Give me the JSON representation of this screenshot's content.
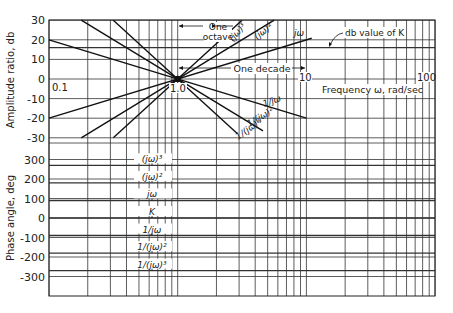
{
  "chart_data": [
    {
      "type": "line",
      "title": "Bode magnitude asymptotes",
      "xlabel": "Frequency ω, rad/sec",
      "ylabel": "Amplitude ratio, db",
      "xscale": "log",
      "xlim": [
        0.1,
        100
      ],
      "ylim": [
        -30,
        30
      ],
      "x_tick_labels": [
        "0.1",
        "1.0",
        "10",
        "100"
      ],
      "y_ticks": [
        30,
        20,
        10,
        0,
        -10,
        -20,
        -30
      ],
      "grid": true,
      "annotations": [
        "One octave",
        "One decade",
        "db value of K"
      ],
      "k_db": 16,
      "series": [
        {
          "name": "jω",
          "slope_db_per_decade": 20,
          "x": [
            0.1,
            11
          ],
          "y": [
            -20,
            20.8
          ]
        },
        {
          "name": "(jω)²",
          "slope_db_per_decade": 40,
          "x": [
            0.178,
            5.62
          ],
          "y": [
            -30,
            30
          ]
        },
        {
          "name": "(jω)³",
          "slope_db_per_decade": 60,
          "x": [
            0.316,
            3.16
          ],
          "y": [
            -30,
            30
          ]
        },
        {
          "name": "1/jω",
          "slope_db_per_decade": -20,
          "x": [
            0.1,
            10
          ],
          "y": [
            20,
            -20
          ]
        },
        {
          "name": "1/(jω)²",
          "slope_db_per_decade": -40,
          "x": [
            0.178,
            4.6
          ],
          "y": [
            30,
            -26.5
          ]
        },
        {
          "name": "1/(jω)³",
          "slope_db_per_decade": -60,
          "x": [
            0.316,
            2.9
          ],
          "y": [
            30,
            -27.8
          ]
        },
        {
          "name": "K",
          "slope_db_per_decade": 0,
          "x": [
            0.1,
            100
          ],
          "y": [
            16,
            16
          ]
        }
      ]
    },
    {
      "type": "line",
      "title": "Bode phase asymptotes",
      "xlabel": "",
      "ylabel": "Phase angle, deg",
      "xscale": "log",
      "xlim": [
        0.1,
        100
      ],
      "ylim": [
        -400,
        300
      ],
      "y_ticks": [
        300,
        200,
        100,
        0,
        -100,
        -200,
        -300
      ],
      "grid": true,
      "series": [
        {
          "name": "(jω)³",
          "value": 270
        },
        {
          "name": "(jω)²",
          "value": 180
        },
        {
          "name": "jω",
          "value": 90
        },
        {
          "name": "K",
          "value": 0
        },
        {
          "name": "1/jω",
          "value": -90
        },
        {
          "name": "1/(jω)²",
          "value": -180
        },
        {
          "name": "1/(jω)³",
          "value": -270
        }
      ]
    }
  ],
  "labels": {
    "amp_axis": "Amplitude ratio, db",
    "phase_axis": "Phase angle, deg",
    "freq_axis": "Frequency ω, rad/sec",
    "one_octave_1": "One",
    "one_octave_2": "octave",
    "one_decade": "One decade",
    "db_value_k": "db value of K",
    "x01": "0.1",
    "x1": "1.0",
    "x10": "10",
    "x100": "100",
    "amp_ticks": [
      "30",
      "20",
      "10",
      "0",
      "-10",
      "-20",
      "-30"
    ],
    "phase_ticks": [
      "300",
      "200",
      "100",
      "0",
      "-100",
      "-200",
      "-300"
    ],
    "line_jw": "jω",
    "line_jw2": "(jω)²",
    "line_jw3": "(jω)³",
    "line_1jw": "1/jω",
    "line_1jw2": "1/(jω)²",
    "line_1jw3": "1/(jω)³",
    "phase_labels": [
      "(jω)³",
      "(jω)²",
      "jω",
      "K",
      "1/jω",
      "1/(jω)²",
      "1/(jω)³"
    ]
  }
}
